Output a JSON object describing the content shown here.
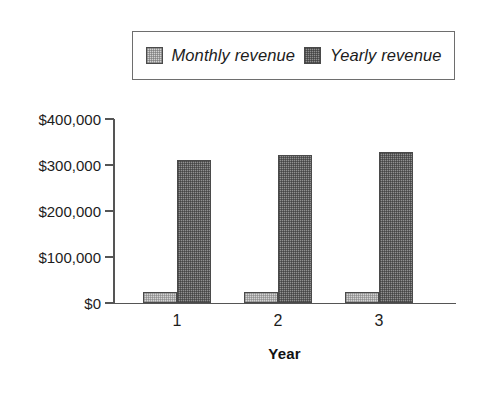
{
  "chart_data": {
    "type": "bar",
    "title": "",
    "subtitle": "",
    "xlabel": "Year",
    "ylabel": "",
    "categories": [
      "1",
      "2",
      "3"
    ],
    "series": [
      {
        "name": "Monthly revenue",
        "values": [
          24000,
          24000,
          25000
        ],
        "color": "#d4d4d4"
      },
      {
        "name": "Yearly revenue",
        "values": [
          310000,
          322000,
          328000
        ],
        "color": "#909090"
      }
    ],
    "ylim": [
      0,
      400000
    ],
    "y_ticks": [
      0,
      100000,
      200000,
      300000,
      400000
    ],
    "y_tick_labels": [
      "$0",
      "$100,000",
      "$200,000",
      "$300,000",
      "$400,000"
    ],
    "x_tick_labels": [
      "1",
      "2",
      "3"
    ],
    "grid": false,
    "legend_position": "top",
    "legend_entries": [
      "Monthly revenue",
      "Yearly revenue"
    ],
    "annotations": []
  },
  "legend": {
    "entries": [
      {
        "label": "Monthly revenue",
        "swatch": "light-gray-swatch"
      },
      {
        "label": "Yearly revenue",
        "swatch": "dark-gray-swatch"
      }
    ]
  },
  "axes": {
    "y_tick_labels": [
      "$400,000",
      "$300,000",
      "$200,000",
      "$100,000",
      "$0"
    ],
    "x_tick_labels": [
      "1",
      "2",
      "3"
    ],
    "x_axis_title": "Year"
  }
}
